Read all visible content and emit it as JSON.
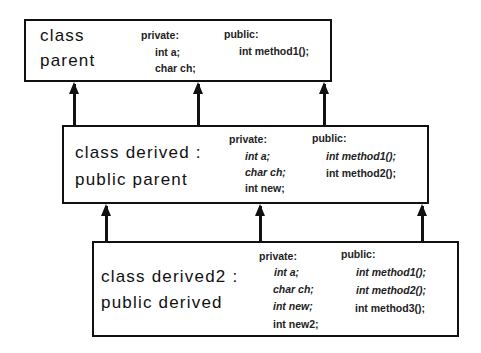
{
  "classes": {
    "parent": {
      "title_line1": "class",
      "title_line2": "parent",
      "private_label": "private:",
      "private_members": [
        "int a;",
        "char ch;"
      ],
      "public_label": "public:",
      "public_members": [
        "int method1();"
      ]
    },
    "derived": {
      "title_line1": "class derived :",
      "title_line2": "public parent",
      "private_label": "private:",
      "private_members": [
        "int a;",
        "char ch;",
        "int new;"
      ],
      "public_label": "public:",
      "public_members": [
        "int method1();",
        "int method2();"
      ]
    },
    "derived2": {
      "title_line1": "class derived2 :",
      "title_line2": "public derived",
      "private_label": "private:",
      "private_members": [
        "int a;",
        "char ch;",
        "int new;",
        "int new2;"
      ],
      "public_label": "public:",
      "public_members": [
        "int method1();",
        "int method2();",
        "int method3();"
      ]
    }
  },
  "inheritance": [
    {
      "from": "derived",
      "to": "parent",
      "arrow_count": 3
    },
    {
      "from": "derived2",
      "to": "derived",
      "arrow_count": 3
    }
  ],
  "styles": {
    "inherited_members_italic": true,
    "line_color": "#111111",
    "background": "#ffffff"
  }
}
